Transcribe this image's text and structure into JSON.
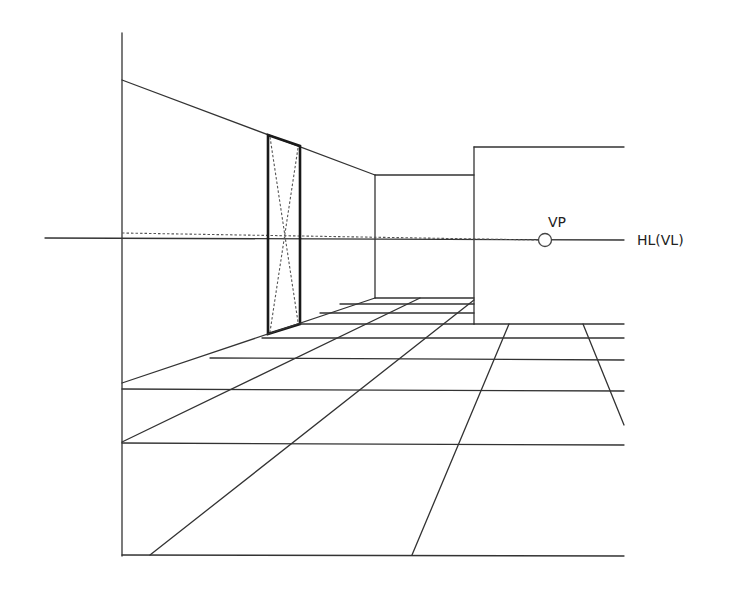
{
  "diagram": {
    "labels": {
      "vanishing_point": "VP",
      "horizon_line": "HL(VL)"
    },
    "colors": {
      "line": "#333333",
      "background": "#ffffff"
    },
    "horizon_y": 238,
    "vanishing_point": {
      "x": 545,
      "y": 240
    },
    "elements": [
      "left-wall",
      "back-wall",
      "right-wall-block",
      "door-opening",
      "floor-tile-grid",
      "horizon-line",
      "vanishing-point"
    ]
  }
}
